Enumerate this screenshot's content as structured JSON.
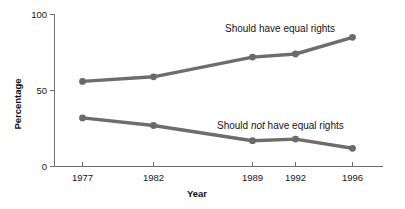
{
  "chart_data": {
    "type": "line",
    "title": "",
    "subtitle": "",
    "xlabel": "Year",
    "ylabel": "Percentage",
    "categories": [
      "1977",
      "1982",
      "1989",
      "1992",
      "1996"
    ],
    "x": [
      1977,
      1982,
      1989,
      1992,
      1996
    ],
    "xlim": [
      1975.5,
      1998
    ],
    "ylim": [
      0,
      100
    ],
    "yticks": [
      "0",
      "50",
      "100"
    ],
    "ytick_values": [
      0,
      50,
      100
    ],
    "grid": false,
    "legend_position": "inline-annotation",
    "series": [
      {
        "name": "Should have equal rights",
        "values": [
          56,
          59,
          72,
          74,
          85
        ],
        "color": "#6d6d6d",
        "marker": "circle"
      },
      {
        "name": "Should not have equal rights",
        "values": [
          32,
          27,
          17,
          18,
          12
        ],
        "color": "#6d6d6d",
        "marker": "circle"
      }
    ],
    "annotations": [
      {
        "id": "upper-series-label",
        "text_before": "Should have equal rights",
        "text_italic": "",
        "text_after": "",
        "x": 1988.6,
        "y": 92
      },
      {
        "id": "lower-series-label",
        "text_before": "Should ",
        "text_italic": "not",
        "text_after": " have equal rights",
        "x": 1989.4,
        "y": 30
      }
    ],
    "colors": {
      "line": "#6d6d6d",
      "marker": "#6a6a6a",
      "axis": "#6e6e6e",
      "text": "#161616",
      "background": "#ffffff"
    }
  }
}
